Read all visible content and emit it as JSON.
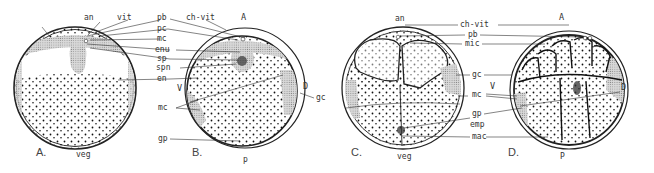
{
  "figure": {
    "panels": [
      {
        "id": "A",
        "label": "A.",
        "bottom_label": "veg",
        "top_label": "an"
      },
      {
        "id": "B",
        "label": "B.",
        "bottom_label": "p",
        "top_label": "A",
        "side_labels": {
          "left": "V",
          "right": "D"
        }
      },
      {
        "id": "C",
        "label": "C.",
        "bottom_label": "veg",
        "top_label": "an"
      },
      {
        "id": "D",
        "label": "D.",
        "bottom_label": "P",
        "top_label": "A",
        "side_labels": {
          "left": "V",
          "right": "D"
        }
      }
    ],
    "labels_ab": {
      "an": "an",
      "vit": "vit",
      "pb": "pb",
      "pc": "pc",
      "mc": "mc",
      "enu": "enu",
      "sp": "sp",
      "spn": "spn",
      "en": "en",
      "ch_vit": "ch-vit",
      "mc2": "mc",
      "gp": "gp",
      "gc": "gc"
    },
    "labels_cd": {
      "ch_vit": "ch-vit",
      "pb": "pb",
      "mic": "mic",
      "gc": "gc",
      "mc": "mc",
      "gp": "gp",
      "emp": "emp",
      "mac": "mac"
    }
  }
}
